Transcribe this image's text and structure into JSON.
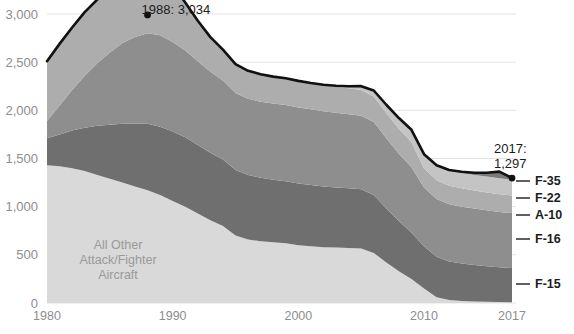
{
  "chart_data": {
    "type": "area",
    "stacked": true,
    "title": "",
    "subtitle": "",
    "xlabel": "",
    "ylabel": "",
    "x": [
      1980,
      1981,
      1982,
      1983,
      1984,
      1985,
      1986,
      1987,
      1988,
      1989,
      1990,
      1991,
      1992,
      1993,
      1994,
      1995,
      1996,
      1997,
      1998,
      1999,
      2000,
      2001,
      2002,
      2003,
      2004,
      2005,
      2006,
      2007,
      2008,
      2009,
      2010,
      2011,
      2012,
      2013,
      2014,
      2015,
      2016,
      2017
    ],
    "xlim": [
      1980,
      2017
    ],
    "ylim": [
      0,
      3000
    ],
    "yticks": [
      0,
      500,
      1000,
      1500,
      2000,
      2500,
      3000
    ],
    "ytick_labels": [
      "0",
      "500",
      "1,000",
      "1,500",
      "2,000",
      "2,500",
      "3,000"
    ],
    "xticks": [
      1980,
      1990,
      2000,
      2010,
      2017
    ],
    "xtick_labels": [
      "1980",
      "1990",
      "2000",
      "2010",
      "2017"
    ],
    "grid": true,
    "legend_position": "right-inline",
    "series": [
      {
        "name": "All Other Attack/Fighter Aircraft",
        "color": "#d9d9d9",
        "values": [
          1430,
          1420,
          1400,
          1370,
          1330,
          1290,
          1250,
          1210,
          1170,
          1120,
          1060,
          1000,
          930,
          860,
          800,
          700,
          660,
          640,
          630,
          620,
          600,
          590,
          580,
          575,
          570,
          565,
          520,
          420,
          330,
          250,
          150,
          60,
          30,
          20,
          15,
          12,
          10,
          8
        ]
      },
      {
        "name": "F-15",
        "color": "#6f6f6f",
        "values": [
          280,
          330,
          390,
          450,
          510,
          560,
          610,
          650,
          690,
          710,
          720,
          720,
          710,
          700,
          690,
          680,
          670,
          660,
          650,
          645,
          640,
          635,
          630,
          625,
          620,
          615,
          600,
          560,
          520,
          480,
          440,
          420,
          400,
          390,
          380,
          370,
          360,
          355
        ]
      },
      {
        "name": "F-16",
        "color": "#8e8e8e",
        "values": [
          180,
          300,
          420,
          540,
          650,
          750,
          840,
          900,
          940,
          950,
          930,
          900,
          870,
          840,
          820,
          800,
          790,
          790,
          790,
          790,
          790,
          785,
          780,
          775,
          770,
          765,
          760,
          730,
          700,
          680,
          610,
          600,
          595,
          590,
          585,
          580,
          575,
          570
        ]
      },
      {
        "name": "A-10",
        "color": "#adadad",
        "values": [
          620,
          640,
          650,
          660,
          660,
          655,
          650,
          645,
          640,
          620,
          590,
          500,
          420,
          360,
          320,
          300,
          290,
          285,
          280,
          278,
          276,
          274,
          272,
          270,
          268,
          266,
          264,
          262,
          260,
          258,
          200,
          195,
          192,
          190,
          188,
          186,
          184,
          182
        ]
      },
      {
        "name": "F-22",
        "color": "#c4c4c4",
        "values": [
          0,
          0,
          0,
          0,
          0,
          0,
          0,
          0,
          0,
          0,
          0,
          0,
          0,
          0,
          0,
          0,
          0,
          0,
          0,
          0,
          0,
          0,
          4,
          10,
          22,
          40,
          62,
          86,
          110,
          130,
          145,
          152,
          157,
          160,
          162,
          164,
          165,
          166
        ]
      },
      {
        "name": "F-35",
        "color": "#7a7a7a",
        "values": [
          0,
          0,
          0,
          0,
          0,
          0,
          0,
          0,
          0,
          0,
          0,
          0,
          0,
          0,
          0,
          0,
          0,
          0,
          0,
          0,
          0,
          0,
          0,
          0,
          0,
          0,
          0,
          0,
          0,
          0,
          0,
          2,
          6,
          12,
          22,
          40,
          70,
          16
        ]
      }
    ],
    "totals": [
      2510,
      2690,
      2860,
      3020,
      3150,
      3205,
      3250,
      3305,
      3034,
      3400,
      3300,
      3120,
      2930,
      2760,
      2630,
      2480,
      2400,
      2375,
      2350,
      2333,
      2306,
      2284,
      2266,
      2255,
      2250,
      2251,
      2206,
      2058,
      1920,
      1798,
      1545,
      1429,
      1380,
      1362,
      1352,
      1352,
      1364,
      1297
    ],
    "annotations": [
      {
        "id": "peak",
        "label": "1988: 3,034",
        "x": 1988,
        "y": 3034
      },
      {
        "id": "end",
        "label_line1": "2017:",
        "label_line2": "1,297",
        "x": 2017,
        "y": 1297
      }
    ],
    "inplot_labels": [
      {
        "id": "all-other",
        "lines": [
          "All Other",
          "Attack/Fighter",
          "Aircraft"
        ]
      }
    ],
    "legend_labels": [
      "F-35",
      "F-22",
      "A-10",
      "F-16",
      "F-15"
    ]
  },
  "colors": {
    "background": "#ffffff",
    "gridline": "#e3e3e3",
    "tick_text": "#8d8d8d",
    "label_text": "#1c1c1c",
    "inplot_text": "#9a9a9a",
    "topline": "#111111"
  }
}
